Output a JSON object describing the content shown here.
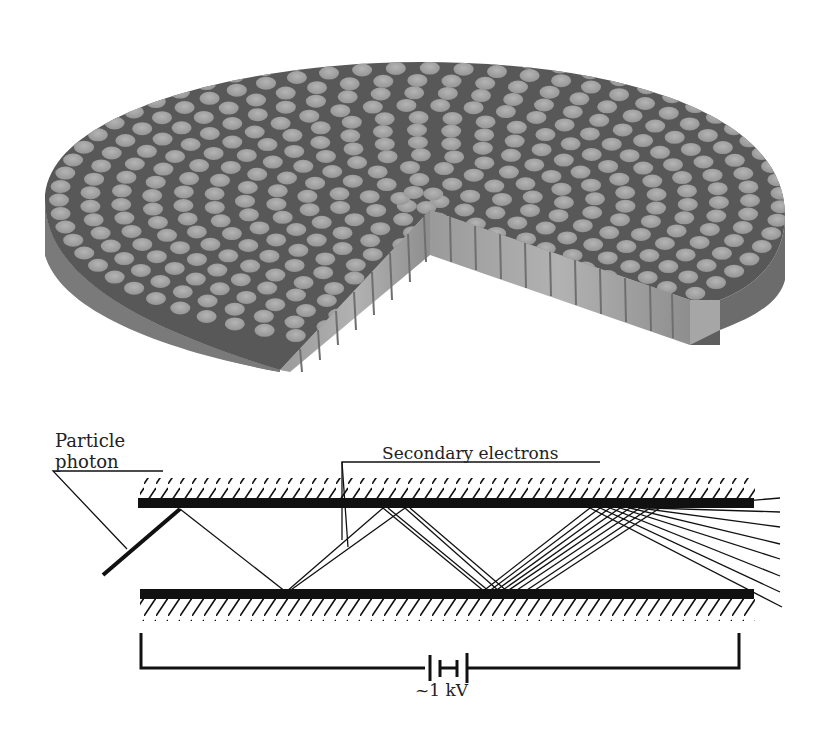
{
  "figure": {
    "disc": {
      "description": "3D cut-away view of a microchannel plate disc with hexagonally packed channels",
      "colors": {
        "top_face": "#5a5a5a",
        "side_face": "#8c8c8c",
        "channel": "#a9a9a9",
        "channel_wall": "#b8b8b8"
      }
    },
    "channel_diagram": {
      "labels": {
        "particle_line1": "Particle",
        "particle_line2": "photon",
        "secondary_electrons": "Secondary electrons",
        "voltage": "~1 kV"
      },
      "colors": {
        "wall": "#111111",
        "hatch": "#111111",
        "trajectory": "#111111"
      }
    }
  }
}
